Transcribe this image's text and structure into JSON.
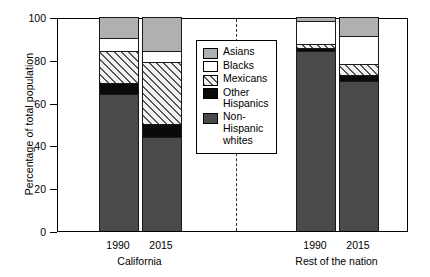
{
  "chart_data": {
    "type": "bar",
    "title": "",
    "subtitle": "",
    "xlabel": "",
    "ylabel": "Percentage of total population",
    "stacked": true,
    "stack_total": 100,
    "ylim": [
      0,
      100
    ],
    "yticks": [
      0,
      20,
      40,
      60,
      80,
      100
    ],
    "ytick_labels": [
      "0",
      "20",
      "40",
      "60",
      "80",
      "100"
    ],
    "grid": false,
    "legend_position": "inside-center",
    "categories": [
      "1990",
      "2015",
      "1990",
      "2015"
    ],
    "groups": [
      {
        "name": "California",
        "categories": [
          "1990",
          "2015"
        ]
      },
      {
        "name": "Rest of the nation",
        "categories": [
          "1990",
          "2015"
        ]
      }
    ],
    "series": [
      {
        "name": "Non-Hispanic whites",
        "color": "#4a4a4a",
        "pattern": "solid-dark-grey",
        "values": [
          64,
          44,
          84,
          70
        ]
      },
      {
        "name": "Other Hispanics",
        "color": "#0a0a0a",
        "pattern": "solid-black",
        "values": [
          5,
          6,
          1.5,
          3
        ]
      },
      {
        "name": "Mexicans",
        "color": "#f2f2f2",
        "pattern": "diagonal-hatch",
        "values": [
          15,
          29,
          2,
          5
        ]
      },
      {
        "name": "Blacks",
        "color": "#ffffff",
        "pattern": "solid-white",
        "values": [
          6,
          5,
          10.5,
          13
        ]
      },
      {
        "name": "Asians",
        "color": "#b0b0b0",
        "pattern": "solid-mid-grey",
        "values": [
          10,
          16,
          2,
          9
        ]
      }
    ],
    "annotations": [
      {
        "type": "vertical-dashed-line",
        "label": "group-separator"
      }
    ]
  },
  "legend": {
    "items": [
      {
        "label": "Asians",
        "swatch": "mid-grey"
      },
      {
        "label": "Blacks",
        "swatch": "white"
      },
      {
        "label": "Mexicans",
        "swatch": "hatched"
      },
      {
        "label": "Other\nHispanics",
        "swatch": "black"
      },
      {
        "label": "Non-\nHispanic\nwhites",
        "swatch": "dark-grey"
      }
    ]
  }
}
